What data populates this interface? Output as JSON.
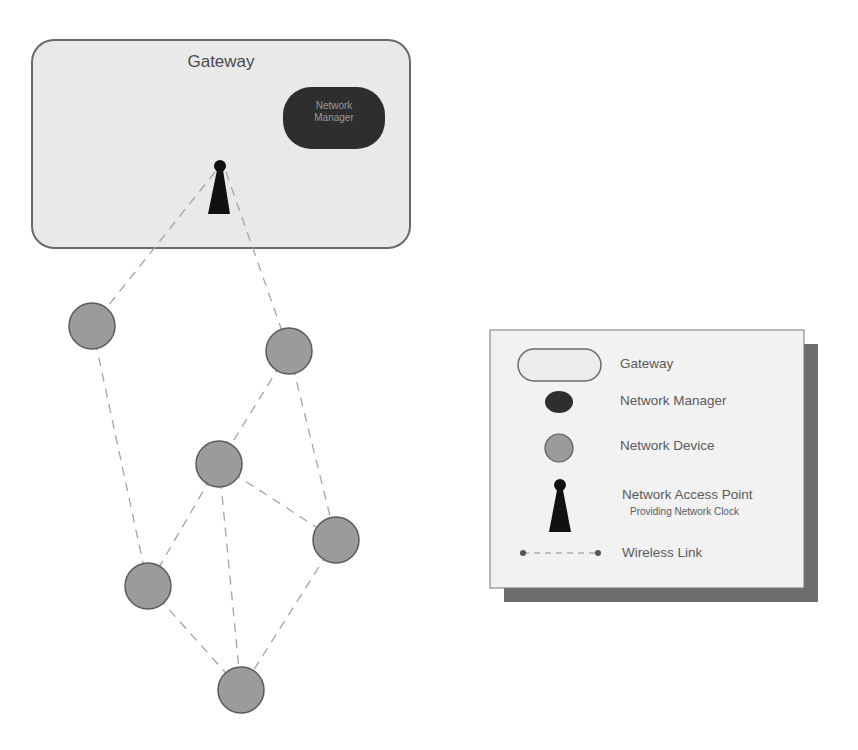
{
  "gateway": {
    "title": "Gateway",
    "network_manager_label_line1": "Network",
    "network_manager_label_line2": "Manager"
  },
  "access_point": {
    "x": 220,
    "y": 168
  },
  "nodes": [
    {
      "id": "n1",
      "x": 92,
      "y": 326
    },
    {
      "id": "n2",
      "x": 289,
      "y": 351
    },
    {
      "id": "n3",
      "x": 219,
      "y": 464
    },
    {
      "id": "n4",
      "x": 336,
      "y": 540
    },
    {
      "id": "n5",
      "x": 148,
      "y": 586
    },
    {
      "id": "n6",
      "x": 241,
      "y": 690
    }
  ],
  "links": [
    [
      "ap",
      "n1"
    ],
    [
      "ap",
      "n2"
    ],
    [
      "n1",
      "n5"
    ],
    [
      "n2",
      "n3"
    ],
    [
      "n2",
      "n4"
    ],
    [
      "n3",
      "n4"
    ],
    [
      "n3",
      "n5"
    ],
    [
      "n3",
      "n6"
    ],
    [
      "n4",
      "n6"
    ],
    [
      "n5",
      "n6"
    ]
  ],
  "legend": {
    "items": [
      {
        "icon": "gateway-shape",
        "label": "Gateway"
      },
      {
        "icon": "network-manager-shape",
        "label": "Network Manager"
      },
      {
        "icon": "network-device-circle",
        "label": "Network Device"
      },
      {
        "icon": "access-point-icon",
        "label": "Network Access Point",
        "sublabel": "Providing Network Clock"
      },
      {
        "icon": "wireless-link-line",
        "label": "Wireless Link"
      }
    ]
  },
  "colors": {
    "gateway_fill": "#e8e8e8",
    "gateway_border": "#6a6a6a",
    "manager_fill": "#2e2e2e",
    "device_fill": "#9a9a9a",
    "device_border": "#5a5a5a",
    "link": "#a0a0a0",
    "legend_bg": "#f2f2f2",
    "legend_shadow": "#6e6e6e"
  }
}
